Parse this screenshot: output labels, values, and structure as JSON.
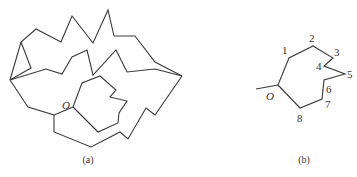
{
  "figure_a": {
    "caption": "(a)",
    "origin_label": "O",
    "paths": [
      {
        "name": "outer-top-chain",
        "points": "10,80 21,42 36,29 61,42 72,16 93,43 108,10 114,36 135,36 155,62 182,76"
      },
      {
        "name": "left-spur",
        "points": "10,80 31,68 21,42"
      },
      {
        "name": "middle-chain",
        "points": "10,80 46,69 62,74 72,57 87,50 93,75 116,50 127,72 155,69 182,76"
      },
      {
        "name": "outer-bottom-chain",
        "points": "10,80 28,107 54,115 54,132 91,147 120,132 128,139 146,108 155,115 182,76"
      },
      {
        "name": "inner-loop",
        "points": "73,107 82,83 100,76 116,90 110,97 127,101 119,113 118,123 98,132 73,107"
      },
      {
        "name": "origin-link",
        "points": "54,115 73,107"
      }
    ],
    "origin_pos": {
      "x": 64,
      "y": 107
    }
  },
  "figure_b": {
    "caption": "(b)",
    "origin_label": "O",
    "path": "256,89 278,85 289,58 313,46 333,58 324,66 345,74 324,80 322,99 300,108 278,85",
    "vertices": [
      {
        "label": "1",
        "x": 282,
        "y": 54
      },
      {
        "label": "2",
        "x": 310,
        "y": 42
      },
      {
        "label": "3",
        "x": 334,
        "y": 54
      },
      {
        "label": "4",
        "x": 316,
        "y": 67
      },
      {
        "label": "5",
        "x": 347,
        "y": 78
      },
      {
        "label": "6",
        "x": 326,
        "y": 93
      },
      {
        "label": "7",
        "x": 325,
        "y": 108
      },
      {
        "label": "8",
        "x": 297,
        "y": 122
      }
    ],
    "origin_pos": {
      "x": 268,
      "y": 99
    }
  }
}
